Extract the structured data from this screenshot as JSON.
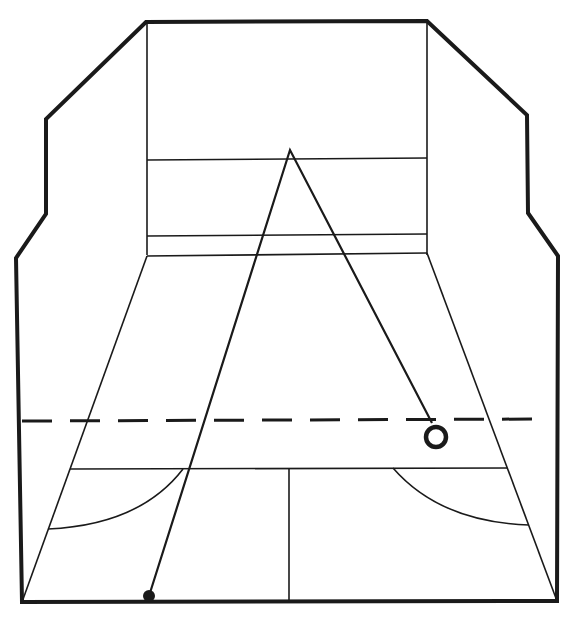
{
  "diagram": {
    "title": "",
    "colors": {
      "ink": "#1a1a1a",
      "background": "#ffffff"
    },
    "outline_points": "22,602 16,258 46,214 46,119 146,22 427,21 527,115 528,213 558,256 557,601",
    "front_wall": {
      "left_x": 147,
      "right_x": 427,
      "top_y": 22,
      "upper_line_y": 160,
      "lower_line_y": 236,
      "floor_edge_y": 255
    },
    "side_floor_lines": [
      {
        "x1": 147,
        "y1": 256,
        "x2": 22,
        "y2": 602
      },
      {
        "x1": 427,
        "y1": 253,
        "x2": 557,
        "y2": 601
      }
    ],
    "short_line": {
      "x1": 70,
      "y1": 469,
      "x2": 507,
      "y2": 468
    },
    "half_court_line": {
      "x1": 289,
      "y1": 469,
      "x2": 289,
      "y2": 602
    },
    "service_boxes": [
      {
        "name": "left",
        "path": "M 183 469 Q 140 525 48 529"
      },
      {
        "name": "right",
        "path": "M 393 468 Q 440 522 529 525"
      }
    ],
    "dashed_line": {
      "x1": 22,
      "y1": 421,
      "x2": 542,
      "y2": 419,
      "dash": "30 18"
    },
    "ball_path": "149,596 290,150 432,423",
    "player_start": {
      "cx": 149,
      "cy": 596,
      "r": 6
    },
    "ball_landing": {
      "cx": 436,
      "cy": 437,
      "r": 10
    },
    "back_wall_y": 602
  }
}
